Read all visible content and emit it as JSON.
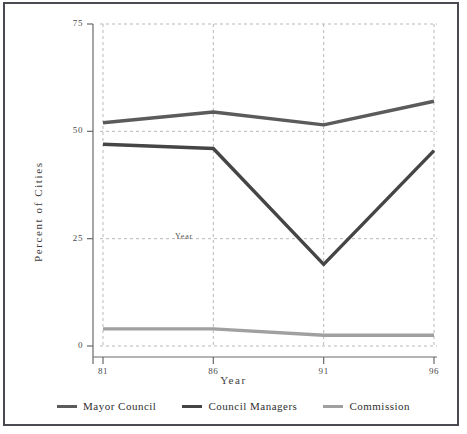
{
  "chart_data": {
    "type": "line",
    "title": "",
    "xlabel": "Year",
    "ylabel": "Percent of Cities",
    "categories": [
      "81",
      "86",
      "91",
      "96"
    ],
    "x": [
      81,
      86,
      91,
      96
    ],
    "xlim": [
      81,
      96
    ],
    "ylim": [
      0,
      75
    ],
    "yticks": [
      0,
      25,
      50,
      75
    ],
    "ytick_labels": [
      "0",
      "25",
      "50",
      "75"
    ],
    "xticks": [
      81,
      86,
      91,
      96
    ],
    "xtick_labels": [
      "81",
      "86",
      "91",
      "96"
    ],
    "grid": "dashed-both",
    "legend_position": "bottom",
    "annotations": [
      {
        "text": "Year",
        "x": 86,
        "y": 24
      }
    ],
    "series": [
      {
        "name": "Mayor Council",
        "color": "#5b5b5b",
        "values": [
          52,
          54.5,
          51.5,
          57
        ]
      },
      {
        "name": "Council Managers",
        "color": "#454545",
        "values": [
          47,
          46,
          19,
          45.5
        ]
      },
      {
        "name": "Commission",
        "color": "#a0a0a0",
        "values": [
          4,
          4,
          2.5,
          2.5
        ]
      }
    ]
  },
  "legend": {
    "items": [
      {
        "label": "Mayor Council",
        "color": "#5b5b5b"
      },
      {
        "label": "Council Managers",
        "color": "#454545"
      },
      {
        "label": "Commission",
        "color": "#a0a0a0"
      }
    ]
  },
  "axes": {
    "y_title": "Percent of Cities",
    "x_title": "Year",
    "y_tick_labels": [
      "75",
      "50",
      "25",
      "0"
    ],
    "x_tick_labels": [
      "81",
      "86",
      "91",
      "96"
    ]
  },
  "inner_note": "Year",
  "colors": {
    "frame": "#4a4a52",
    "grid": "#b9b9b9",
    "axis": "#6a6a6a",
    "text": "#3a3a3a",
    "background": "#ffffff"
  }
}
